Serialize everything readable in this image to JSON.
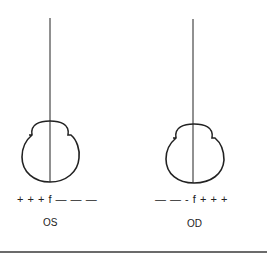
{
  "figure": {
    "left_panel": {
      "eye_label": "OS",
      "sign_sequence": "+ + + f — — —"
    },
    "right_panel": {
      "eye_label": "OD",
      "sign_sequence": "— — - f + + +"
    },
    "colors": {
      "stroke": "#222222",
      "background": "#ffffff",
      "rule": "#6b6b6b"
    }
  }
}
